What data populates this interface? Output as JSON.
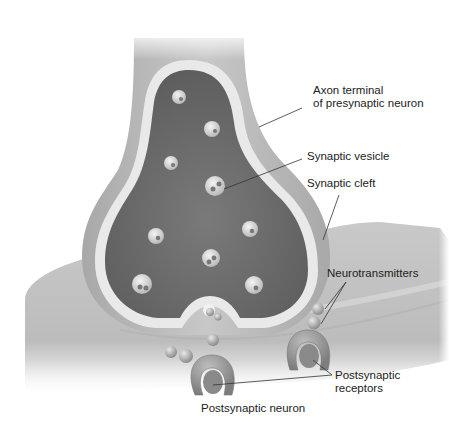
{
  "diagram": {
    "labels": {
      "axon_terminal_line1": "Axon terminal",
      "axon_terminal_line2": "of presynaptic neuron",
      "synaptic_vesicle": "Synaptic vesicle",
      "synaptic_cleft": "Synaptic cleft",
      "neurotransmitters": "Neurotransmitters",
      "postsynaptic_receptors_line1": "Postsynaptic",
      "postsynaptic_receptors_line2": "receptors",
      "postsynaptic_neuron": "Postsynaptic neuron"
    },
    "colors": {
      "background": "#ffffff",
      "membrane_outer": "#bdbdbd",
      "membrane_light": "#e6e6e6",
      "cytoplasm_dark": "#6e6e6e",
      "postsynaptic": "#c4c4c4",
      "vesicle": "#dcdcdc",
      "text": "#222222"
    }
  }
}
